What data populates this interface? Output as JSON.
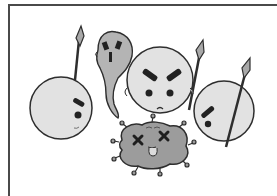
{
  "illustration": {
    "description": "Cartoon of immune cells with spears surrounding a defeated virus",
    "colors": {
      "background": "#ffffff",
      "frame": "#4a4a4a",
      "outline": "#2e2e2e",
      "cell_fill": "#e2e2e2",
      "ghost_fill": "#b4b4b4",
      "virus_fill": "#9c9c9c",
      "spearhead_fill": "#a8a8a8"
    },
    "characters": [
      {
        "name": "left-cell",
        "type": "white-blood-cell",
        "expression": "side-glance",
        "holds": "spear"
      },
      {
        "name": "ghost",
        "type": "ghost-cell",
        "expression": "scared"
      },
      {
        "name": "center-cell",
        "type": "white-blood-cell",
        "expression": "angry",
        "holds": "spear"
      },
      {
        "name": "right-cell",
        "type": "white-blood-cell",
        "expression": "side-glance",
        "holds": "spear"
      },
      {
        "name": "virus",
        "type": "virus",
        "expression": "dead (x-eyes, tongue out)"
      }
    ]
  }
}
